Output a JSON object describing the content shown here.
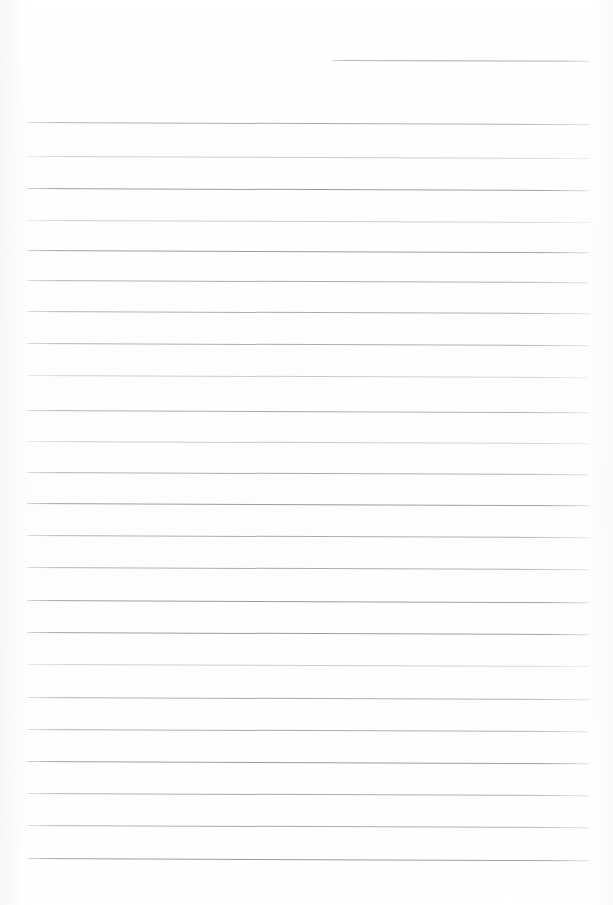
{
  "document": {
    "type": "scanned-ruled-page",
    "title": "Blank lined notebook page",
    "page_width": 613,
    "page_height": 905,
    "background_color": "#fefefe",
    "rule_color": "#a8aab0",
    "rule_color_faint": "#c0c2c8",
    "rule_color_strong": "#989aa1",
    "has_text_content": false,
    "content_text": "",
    "margins": {
      "left": 27,
      "right": 23,
      "top": 52,
      "bottom": 47
    }
  },
  "rules": [
    {
      "id": "rule-01",
      "x": 331,
      "y": 60,
      "width": 259,
      "tilt": 0.18,
      "weight": "normal"
    },
    {
      "id": "rule-02",
      "x": 27,
      "y": 122,
      "width": 563,
      "tilt": 0.22,
      "weight": "normal"
    },
    {
      "id": "rule-03",
      "x": 27,
      "y": 156,
      "width": 563,
      "tilt": 0.2,
      "weight": "faint"
    },
    {
      "id": "rule-04",
      "x": 27,
      "y": 188,
      "width": 562,
      "tilt": 0.22,
      "weight": "strong"
    },
    {
      "id": "rule-05",
      "x": 27,
      "y": 220,
      "width": 563,
      "tilt": 0.2,
      "weight": "faint"
    },
    {
      "id": "rule-06",
      "x": 27,
      "y": 250,
      "width": 562,
      "tilt": 0.24,
      "weight": "strong"
    },
    {
      "id": "rule-07",
      "x": 27,
      "y": 280,
      "width": 562,
      "tilt": 0.22,
      "weight": "normal"
    },
    {
      "id": "rule-08",
      "x": 27,
      "y": 311,
      "width": 563,
      "tilt": 0.22,
      "weight": "normal"
    },
    {
      "id": "rule-09",
      "x": 27,
      "y": 343,
      "width": 562,
      "tilt": 0.22,
      "weight": "normal"
    },
    {
      "id": "rule-10",
      "x": 27,
      "y": 375,
      "width": 562,
      "tilt": 0.22,
      "weight": "faint"
    },
    {
      "id": "rule-11",
      "x": 27,
      "y": 410,
      "width": 562,
      "tilt": 0.24,
      "weight": "normal"
    },
    {
      "id": "rule-12",
      "x": 27,
      "y": 441,
      "width": 563,
      "tilt": 0.22,
      "weight": "faint"
    },
    {
      "id": "rule-13",
      "x": 27,
      "y": 472,
      "width": 562,
      "tilt": 0.22,
      "weight": "normal"
    },
    {
      "id": "rule-14",
      "x": 27,
      "y": 503,
      "width": 562,
      "tilt": 0.24,
      "weight": "strong"
    },
    {
      "id": "rule-15",
      "x": 27,
      "y": 535,
      "width": 562,
      "tilt": 0.22,
      "weight": "normal"
    },
    {
      "id": "rule-16",
      "x": 27,
      "y": 567,
      "width": 562,
      "tilt": 0.22,
      "weight": "normal"
    },
    {
      "id": "rule-17",
      "x": 27,
      "y": 600,
      "width": 562,
      "tilt": 0.24,
      "weight": "strong"
    },
    {
      "id": "rule-18",
      "x": 27,
      "y": 632,
      "width": 562,
      "tilt": 0.22,
      "weight": "strong"
    },
    {
      "id": "rule-19",
      "x": 27,
      "y": 664,
      "width": 562,
      "tilt": 0.2,
      "weight": "faint"
    },
    {
      "id": "rule-20",
      "x": 27,
      "y": 697,
      "width": 563,
      "tilt": 0.22,
      "weight": "normal"
    },
    {
      "id": "rule-21",
      "x": 27,
      "y": 729,
      "width": 562,
      "tilt": 0.22,
      "weight": "normal"
    },
    {
      "id": "rule-22",
      "x": 27,
      "y": 761,
      "width": 562,
      "tilt": 0.24,
      "weight": "strong"
    },
    {
      "id": "rule-23",
      "x": 27,
      "y": 793,
      "width": 562,
      "tilt": 0.22,
      "weight": "normal"
    },
    {
      "id": "rule-24",
      "x": 27,
      "y": 825,
      "width": 562,
      "tilt": 0.22,
      "weight": "normal"
    },
    {
      "id": "rule-25",
      "x": 27,
      "y": 858,
      "width": 562,
      "tilt": 0.24,
      "weight": "strong"
    }
  ]
}
